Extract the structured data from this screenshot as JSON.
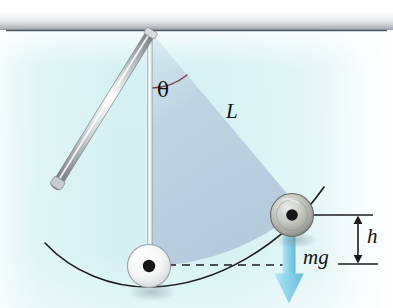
{
  "figure": {
    "type": "physics-diagram",
    "canvas": {
      "width": 393,
      "height": 308
    },
    "labels": {
      "angle": "θ",
      "length": "L",
      "height": "h",
      "weight": "mg"
    },
    "colors": {
      "background_tint": "#d6f0f2",
      "background_right": "#ffffff",
      "swept_sector": "#b9cbdd",
      "ceiling_line": "#54616b",
      "ceiling_shadow": "#9aa0a4",
      "rod_metal_light": "#f4f6f7",
      "rod_metal_mid": "#b9bfc2",
      "rod_metal_dark": "#7e868b",
      "string": "#f2f5f6",
      "bob_left_light": "#ffffff",
      "bob_left_mid": "#dfe3e4",
      "bob_right_light": "#e7e9e6",
      "bob_right_mid": "#a8aaa3",
      "bob_right_dark": "#6e716c",
      "bob_center_dot": "#1a1a18",
      "arc_path": "#18181a",
      "angle_arc": "#8b3b3f",
      "dimension_line": "#1a1a18",
      "dashed_line": "#1a1a18",
      "force_arrow": "#8fd4e8",
      "force_arrow_dark": "#5fbcd8",
      "text": "#10100e"
    },
    "geometry": {
      "pivot": {
        "x": 152,
        "y": 31
      },
      "bob_bottom": {
        "x": 149,
        "y": 266,
        "radius": 21
      },
      "bob_right": {
        "x": 292,
        "y": 215,
        "radius": 21
      },
      "ceiling_y": 31,
      "reference_line_y": 215,
      "base_line_y": 265,
      "height_arrow_x": 358,
      "force_arrow_x": 289,
      "force_arrow_top_y": 226,
      "force_arrow_bottom_y": 303,
      "dashed_from_x": 168,
      "dashed_to_x": 286,
      "dashed_y": 265,
      "angle_arc_radius": 56
    }
  }
}
